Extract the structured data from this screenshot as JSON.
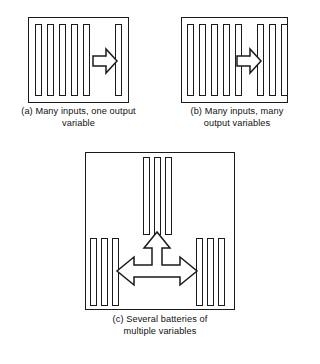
{
  "figure": {
    "background_color": "#ffffff",
    "line_color": "#1a1a1a",
    "fill_color": "#ffffff",
    "panels": [
      {
        "id": "a",
        "caption": "(a) Many inputs, one output\nvariable",
        "box": {
          "x": 28,
          "y": 17,
          "width": 101,
          "height": 86
        },
        "bar_groups": [
          {
            "name": "input-bars",
            "count": 5,
            "orientation": "vertical"
          },
          {
            "name": "output-bars",
            "count": 1,
            "orientation": "vertical"
          }
        ],
        "arrows": [
          {
            "name": "right-arrow",
            "direction": "right"
          }
        ]
      },
      {
        "id": "b",
        "caption": "(b) Many inputs, many\noutput variables",
        "box": {
          "x": 181,
          "y": 17,
          "width": 107,
          "height": 86
        },
        "bar_groups": [
          {
            "name": "input-bars",
            "count": 5,
            "orientation": "vertical"
          },
          {
            "name": "output-bars",
            "count": 3,
            "orientation": "vertical"
          }
        ],
        "arrows": [
          {
            "name": "right-arrow",
            "direction": "right"
          }
        ]
      },
      {
        "id": "c",
        "caption": "(c) Several batteries of\nmultiple variables",
        "box": {
          "x": 85,
          "y": 152,
          "width": 150,
          "height": 158
        },
        "bar_groups": [
          {
            "name": "top-battery-bars",
            "count": 3,
            "orientation": "vertical"
          },
          {
            "name": "left-battery-bars",
            "count": 3,
            "orientation": "vertical"
          },
          {
            "name": "right-battery-bars",
            "count": 3,
            "orientation": "vertical"
          }
        ],
        "arrows": [
          {
            "name": "tri-directional-arrow",
            "direction": "up-left-right"
          }
        ]
      }
    ]
  }
}
